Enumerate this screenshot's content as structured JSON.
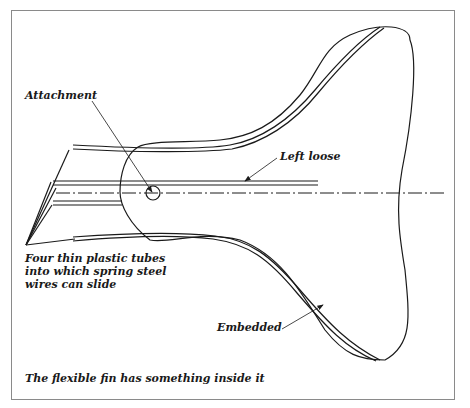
{
  "diagram": {
    "caption": "The flexible fin has something inside it",
    "labels": {
      "attachment": "Attachment",
      "left_loose": "Left loose",
      "embedded": "Embedded",
      "tubes_line1": "Four thin plastic tubes",
      "tubes_line2": "into which spring steel",
      "tubes_line3": "wires can slide"
    },
    "colors": {
      "line": "#1a1a1a",
      "frame": "#8a8a8a",
      "background": "#ffffff"
    }
  }
}
